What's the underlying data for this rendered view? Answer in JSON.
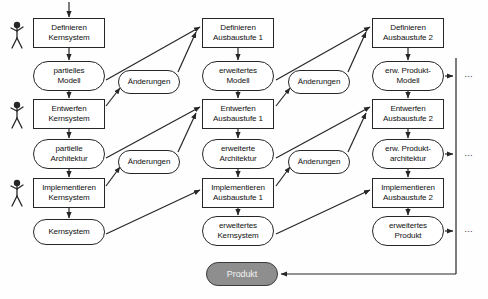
{
  "diagram": {
    "stroke_color": "#262626",
    "product_fill": "#8e8e8e",
    "product_text_color": "#f2f2f2",
    "background": "#fefefe"
  },
  "columns": [
    {
      "id": "kern",
      "name": "Kernsystem"
    },
    {
      "id": "stufe1",
      "name": "Ausbaustufe 1"
    },
    {
      "id": "stufe2",
      "name": "Ausbaustufe 2"
    }
  ],
  "nodes": {
    "def_kern": {
      "kind": "activity",
      "line1": "Definieren",
      "line2": "Kernsystem",
      "x": 33,
      "y": 18,
      "w": 72,
      "h": 30
    },
    "partielles_modell": {
      "kind": "artifact",
      "line1": "partielles",
      "line2": "Modell",
      "x": 33,
      "y": 61,
      "w": 72,
      "h": 30
    },
    "ent_kern": {
      "kind": "activity",
      "line1": "Entwerfen",
      "line2": "Kernsystem",
      "x": 33,
      "y": 99,
      "w": 72,
      "h": 30
    },
    "partielle_arch": {
      "kind": "artifact",
      "line1": "partielle",
      "line2": "Architektur",
      "x": 33,
      "y": 139,
      "w": 72,
      "h": 30
    },
    "imp_kern": {
      "kind": "activity",
      "line1": "Implementieren",
      "line2": "Kernsystem",
      "x": 33,
      "y": 178,
      "w": 72,
      "h": 30
    },
    "kernsystem": {
      "kind": "artifact",
      "line1": "Kernsystem",
      "line2": "",
      "x": 33,
      "y": 219,
      "w": 72,
      "h": 26
    },
    "aend_1": {
      "kind": "change",
      "line1": "Änderungen",
      "line2": "",
      "x": 118,
      "y": 70,
      "w": 62,
      "h": 24
    },
    "aend_2": {
      "kind": "change",
      "line1": "Änderungen",
      "line2": "",
      "x": 118,
      "y": 150,
      "w": 62,
      "h": 24
    },
    "def_a1": {
      "kind": "activity",
      "line1": "Definieren",
      "line2": "Ausbaustufe 1",
      "x": 202,
      "y": 18,
      "w": 72,
      "h": 30
    },
    "erw_modell": {
      "kind": "artifact",
      "line1": "erweitertes",
      "line2": "Modell",
      "x": 202,
      "y": 61,
      "w": 72,
      "h": 30
    },
    "ent_a1": {
      "kind": "activity",
      "line1": "Entwerfen",
      "line2": "Ausbaustufe 1",
      "x": 202,
      "y": 99,
      "w": 72,
      "h": 30
    },
    "erw_arch": {
      "kind": "artifact",
      "line1": "erweiterte",
      "line2": "Architektur",
      "x": 202,
      "y": 139,
      "w": 72,
      "h": 30
    },
    "imp_a1": {
      "kind": "activity",
      "line1": "Implementieren",
      "line2": "Ausbaustufe 1",
      "x": 202,
      "y": 178,
      "w": 72,
      "h": 30
    },
    "erw_kernsystem": {
      "kind": "artifact",
      "line1": "erweitertes",
      "line2": "Kernsystem",
      "x": 202,
      "y": 216,
      "w": 72,
      "h": 30
    },
    "aend_3": {
      "kind": "change",
      "line1": "Änderungen",
      "line2": "",
      "x": 288,
      "y": 70,
      "w": 62,
      "h": 24
    },
    "aend_4": {
      "kind": "change",
      "line1": "Änderungen",
      "line2": "",
      "x": 288,
      "y": 150,
      "w": 62,
      "h": 24
    },
    "def_a2": {
      "kind": "activity",
      "line1": "Definieren",
      "line2": "Ausbaustufe 2",
      "x": 372,
      "y": 18,
      "w": 72,
      "h": 30
    },
    "erw_prod_modell": {
      "kind": "artifact",
      "line1": "erw. Produkt-",
      "line2": "Modell",
      "x": 372,
      "y": 61,
      "w": 72,
      "h": 30
    },
    "ent_a2": {
      "kind": "activity",
      "line1": "Entwerfen",
      "line2": "Ausbaustufe 2",
      "x": 372,
      "y": 99,
      "w": 72,
      "h": 30
    },
    "erw_prod_arch": {
      "kind": "artifact",
      "line1": "erw. Produkt-",
      "line2": "architektur",
      "x": 372,
      "y": 139,
      "w": 72,
      "h": 30
    },
    "imp_a2": {
      "kind": "activity",
      "line1": "Implementieren",
      "line2": "Ausbaustufe 2",
      "x": 372,
      "y": 178,
      "w": 72,
      "h": 30
    },
    "erw_produkt": {
      "kind": "artifact",
      "line1": "erweitertes",
      "line2": "Produkt",
      "x": 372,
      "y": 216,
      "w": 72,
      "h": 30
    },
    "produkt": {
      "kind": "product",
      "line1": "Produkt",
      "line2": "",
      "x": 206,
      "y": 262,
      "w": 72,
      "h": 24
    }
  },
  "actors": [
    {
      "id": "actor-define-core",
      "x": 8,
      "y": 20
    },
    {
      "id": "actor-design-core",
      "x": 8,
      "y": 100
    },
    {
      "id": "actor-implement-core",
      "x": 8,
      "y": 178
    }
  ],
  "continuation": {
    "marker": "…",
    "positions": [
      {
        "x": 464,
        "y": 72
      },
      {
        "x": 464,
        "y": 152
      },
      {
        "x": 464,
        "y": 228
      }
    ]
  }
}
